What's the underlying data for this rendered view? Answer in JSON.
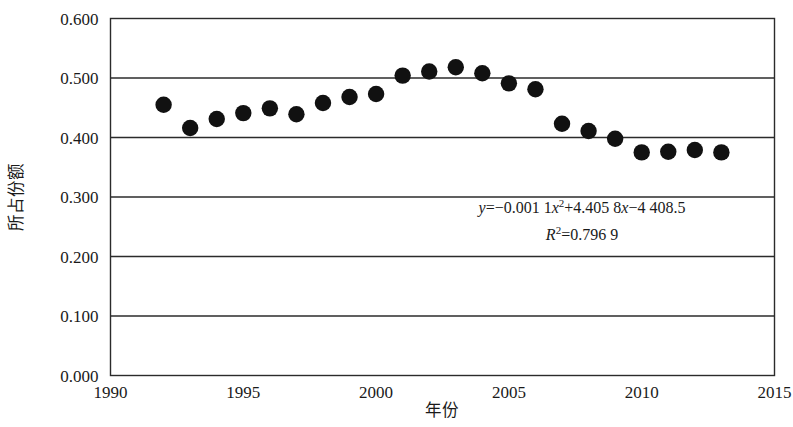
{
  "chart_data": {
    "type": "scatter",
    "title": "",
    "xlabel": "年份",
    "ylabel": "所占份额",
    "xlim": [
      1990,
      2015
    ],
    "ylim": [
      0.0,
      0.6
    ],
    "grid": "horizontal",
    "legend": "none",
    "x_ticks": [
      "1990",
      "1995",
      "2000",
      "2005",
      "2010",
      "2015"
    ],
    "x_tick_values": [
      1990,
      1995,
      2000,
      2005,
      2010,
      2015
    ],
    "y_ticks": [
      "0.000",
      "0.100",
      "0.200",
      "0.300",
      "0.400",
      "0.500",
      "0.600"
    ],
    "y_tick_values": [
      0.0,
      0.1,
      0.2,
      0.3,
      0.4,
      0.5,
      0.6
    ],
    "series": [
      {
        "name": "所占份额",
        "marker": "filled-circle",
        "color": "#111111",
        "x": [
          1992,
          1993,
          1994,
          1995,
          1996,
          1997,
          1998,
          1999,
          2000,
          2001,
          2002,
          2003,
          2004,
          2005,
          2006,
          2007,
          2008,
          2009,
          2010,
          2011,
          2012,
          2013
        ],
        "values": [
          0.455,
          0.416,
          0.431,
          0.441,
          0.449,
          0.439,
          0.458,
          0.468,
          0.473,
          0.504,
          0.511,
          0.518,
          0.508,
          0.491,
          0.481,
          0.423,
          0.411,
          0.398,
          0.375,
          0.376,
          0.379,
          0.375
        ]
      }
    ],
    "trendline": {
      "type": "polynomial",
      "order": 2,
      "style": "dotted",
      "color": "#111111",
      "equation": "y=−0.001 1x²+4.405 8x−4 408.5",
      "r_squared_label": "R²=0.796 9",
      "coefficients": {
        "a": -0.0011,
        "b": 4.4058,
        "c": -4408.5
      },
      "r_squared": 0.7969,
      "x_start": 1992.6,
      "x_end": 2013.4
    },
    "annotations": [
      {
        "name": "equation",
        "text": "y=−0.001 1x²+4.405 8x−4 408.5",
        "x": 2005.6,
        "y": 0.258
      },
      {
        "name": "r-squared",
        "text": "R²=0.796 9",
        "x": 2005.6,
        "y": 0.213
      }
    ]
  },
  "equation_parts": {
    "y_var": "y",
    "eq_sign": "=",
    "term1": "−0.001 1",
    "x_var1": "x",
    "sup1": "2",
    "term2": "+4.405 8",
    "x_var2": "x",
    "term3": "−4 408.5",
    "r_var": "R",
    "r_sup": "2",
    "r_eq": "=0.796 9"
  }
}
